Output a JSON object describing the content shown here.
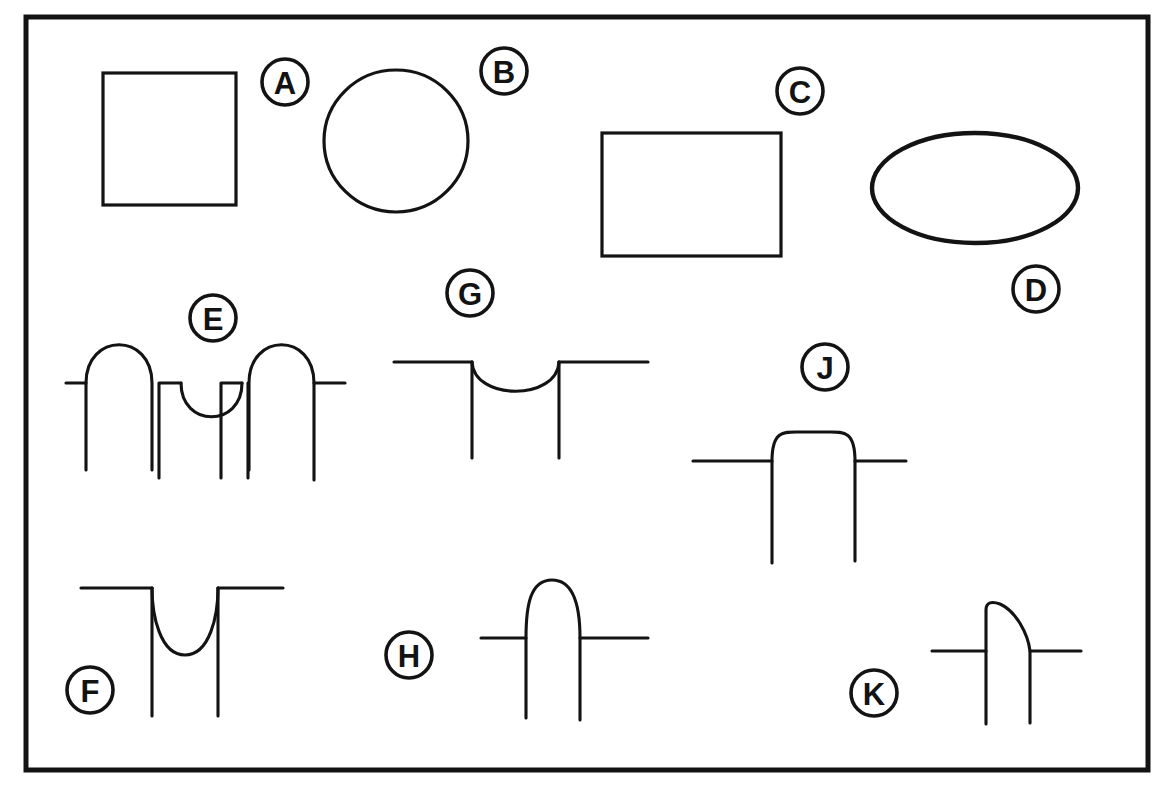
{
  "figure": {
    "background_color": "#ffffff",
    "ink_color": "#131313",
    "frame": {
      "x": 26,
      "y": 17,
      "width": 1122,
      "height": 753,
      "stroke_width": 5
    },
    "canvas": {
      "width": 1167,
      "height": 785
    }
  },
  "labels": [
    {
      "id": "A",
      "text": "A",
      "cx": 285,
      "cy": 82,
      "r": 23
    },
    {
      "id": "B",
      "text": "B",
      "cx": 504,
      "cy": 71,
      "r": 23
    },
    {
      "id": "C",
      "text": "C",
      "cx": 800,
      "cy": 91,
      "r": 23
    },
    {
      "id": "D",
      "text": "D",
      "cx": 1036,
      "cy": 289,
      "r": 23
    },
    {
      "id": "E",
      "text": "E",
      "cx": 213,
      "cy": 318,
      "r": 23
    },
    {
      "id": "F",
      "text": "F",
      "cx": 90,
      "cy": 690,
      "r": 23
    },
    {
      "id": "G",
      "text": "G",
      "cx": 470,
      "cy": 293,
      "r": 23
    },
    {
      "id": "H",
      "text": "H",
      "cx": 409,
      "cy": 655,
      "r": 23
    },
    {
      "id": "J",
      "text": "J",
      "cx": 825,
      "cy": 367,
      "r": 23
    },
    {
      "id": "K",
      "text": "K",
      "cx": 874,
      "cy": 693,
      "r": 23
    }
  ],
  "shapes": [
    {
      "id": "A",
      "name": "square",
      "kind": "rect",
      "description": "Square outline",
      "x": 103,
      "y": 73,
      "width": 133,
      "height": 132
    },
    {
      "id": "B",
      "name": "circle",
      "kind": "circle",
      "description": "Circle outline",
      "cx": 396,
      "cy": 141,
      "rx": 72,
      "ry": 71
    },
    {
      "id": "C",
      "name": "rectangle",
      "kind": "rect",
      "description": "Wide rectangle outline",
      "x": 602,
      "y": 133,
      "width": 179,
      "height": 123
    },
    {
      "id": "D",
      "name": "ellipse",
      "kind": "ellipse",
      "description": "Horizontal ellipse outline",
      "cx": 975,
      "cy": 188,
      "rx": 103,
      "ry": 55
    },
    {
      "id": "E",
      "name": "multi-bump-profile",
      "kind": "profile",
      "description": "Baseline with two upward arches flanking a central downward dip, each with descending legs"
    },
    {
      "id": "F",
      "name": "deep-u-dip-profile",
      "kind": "profile",
      "description": "Baseline with a deep narrow U-shaped downward dip and long descending legs"
    },
    {
      "id": "G",
      "name": "shallow-dip-profile",
      "kind": "profile",
      "description": "Baseline with a shallow wide downward dip and descending legs"
    },
    {
      "id": "H",
      "name": "tall-arch-profile",
      "kind": "profile",
      "description": "Baseline crossed by a tall narrow upward arch with descending legs"
    },
    {
      "id": "J",
      "name": "flat-top-arch-profile",
      "kind": "profile",
      "description": "Baseline crossed by a broad flat-topped rounded arch with long descending legs"
    },
    {
      "id": "K",
      "name": "asymmetric-arch-profile",
      "kind": "profile",
      "description": "Baseline crossed by an asymmetric arch, vertical on the left and sloping on the right"
    }
  ]
}
